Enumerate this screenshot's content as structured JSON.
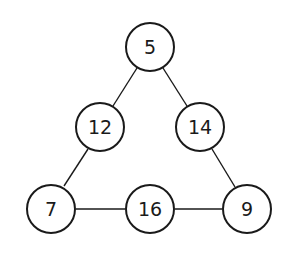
{
  "diagram": {
    "type": "number-triangle",
    "nodes": [
      {
        "id": "top",
        "label": "5",
        "cx": 150,
        "cy": 47
      },
      {
        "id": "mid-left",
        "label": "12",
        "cx": 100,
        "cy": 127
      },
      {
        "id": "mid-right",
        "label": "14",
        "cx": 200,
        "cy": 127
      },
      {
        "id": "bottom-left",
        "label": "7",
        "cx": 51,
        "cy": 209
      },
      {
        "id": "bottom-mid",
        "label": "16",
        "cx": 150,
        "cy": 209
      },
      {
        "id": "bottom-right",
        "label": "9",
        "cx": 247,
        "cy": 209
      }
    ],
    "edges": [
      [
        "top",
        "mid-left"
      ],
      [
        "top",
        "mid-right"
      ],
      [
        "mid-left",
        "bottom-left"
      ],
      [
        "mid-right",
        "bottom-right"
      ],
      [
        "bottom-left",
        "bottom-mid"
      ],
      [
        "bottom-mid",
        "bottom-right"
      ]
    ],
    "colors": {
      "stroke": "#1a1a1a",
      "fill": "#ffffff"
    }
  }
}
